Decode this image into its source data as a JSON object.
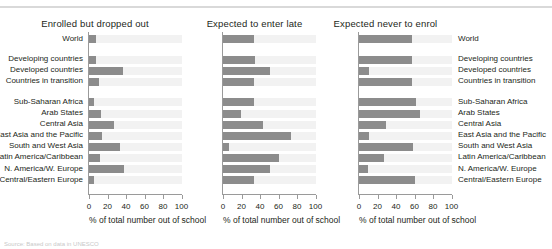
{
  "chart_data": {
    "type": "bar",
    "title": "",
    "orientation": "horizontal",
    "panels": [
      {
        "title": "Enrolled but dropped out",
        "xlabel": "% of total number out of school",
        "xlim": [
          0,
          100
        ],
        "xticks": [
          0,
          20,
          40,
          60,
          80,
          100
        ],
        "label_side": "left",
        "categories": [
          "World",
          "Developing countries",
          "Developed countries",
          "Countries in transition",
          "Sub-Saharan Africa",
          "Arab States",
          "Central Asia",
          "East Asia and the Pacific",
          "South and West Asia",
          "Latin America/Caribbean",
          "N. America/W. Europe",
          "Central/Eastern Europe"
        ],
        "values": [
          8,
          8,
          37,
          11,
          5,
          13,
          27,
          14,
          33,
          12,
          38,
          5
        ]
      },
      {
        "title": "Expected to enter late",
        "xlabel": "% of total number out of school",
        "xlim": [
          0,
          100
        ],
        "xticks": [
          0,
          20,
          40,
          60,
          80,
          100
        ],
        "label_side": "none",
        "categories": [
          "World",
          "Developing countries",
          "Developed countries",
          "Countries in transition",
          "Sub-Saharan Africa",
          "Arab States",
          "Central Asia",
          "East Asia and the Pacific",
          "South and West Asia",
          "Latin America/Caribbean",
          "N. America/W. Europe",
          "Central/Eastern Europe"
        ],
        "values": [
          34,
          35,
          51,
          33,
          33,
          19,
          43,
          73,
          7,
          60,
          51,
          33
        ]
      },
      {
        "title": "Expected never to enrol",
        "xlabel": "% of total number out of school",
        "xlim": [
          0,
          100
        ],
        "xticks": [
          0,
          20,
          40,
          60,
          80,
          100
        ],
        "label_side": "right",
        "categories": [
          "World",
          "Developing countries",
          "Developed countries",
          "Countries in transition",
          "Sub-Saharan Africa",
          "Arab States",
          "Central Asia",
          "East Asia and the Pacific",
          "South and West Asia",
          "Latin America/Caribbean",
          "N. America/W. Europe",
          "Central/Eastern Europe"
        ],
        "values": [
          57,
          57,
          11,
          57,
          62,
          66,
          29,
          11,
          58,
          27,
          10,
          60
        ]
      }
    ],
    "group_gaps_after_rows": [
      0,
      3
    ],
    "grid": false,
    "legend": null,
    "colors": {
      "bar": "#8c8c8c",
      "band": "#f2f2f2",
      "axis": "#9a9a9a",
      "text": "#231f20",
      "top_rule": "#d9d9d9"
    }
  },
  "source": {
    "text": "Source: Based on data in UNESCO"
  }
}
